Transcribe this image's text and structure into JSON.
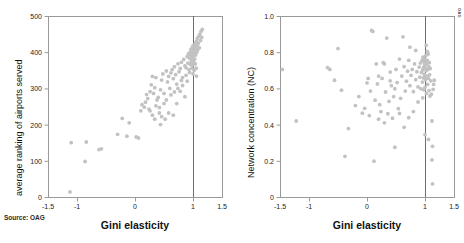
{
  "figure": {
    "source_note": "Source: OAG",
    "corner_mark": "OAG",
    "point_color": "#c2c2c2",
    "frame_color": "#9a9a9a",
    "refline_color": "#6e6e6e"
  },
  "chart_data": [
    {
      "type": "scatter",
      "panel": "left",
      "title": "",
      "xlabel": "Gini elasticity",
      "ylabel": "average ranking of airports served",
      "xlim": [
        -1.5,
        1.5
      ],
      "ylim": [
        0,
        500
      ],
      "xticks": [
        -1.5,
        -1,
        0,
        1,
        1.5
      ],
      "xticklabels": [
        "-1.5",
        "-1",
        "0",
        "1",
        "1.5"
      ],
      "yticks": [
        0,
        100,
        200,
        300,
        400,
        500
      ],
      "yticklabels": [
        "0",
        "100",
        "200",
        "300",
        "400",
        "500"
      ],
      "grid": false,
      "legend": "none",
      "annotations": [
        {
          "type": "vline",
          "x": 1,
          "label": "reference line at Gini elasticity = 1"
        }
      ],
      "points": [
        [
          -1.12,
          14
        ],
        [
          -1.1,
          150
        ],
        [
          -0.86,
          98
        ],
        [
          -0.84,
          152
        ],
        [
          -0.62,
          131
        ],
        [
          -0.58,
          133
        ],
        [
          -0.3,
          173
        ],
        [
          -0.22,
          217
        ],
        [
          -0.14,
          168
        ],
        [
          -0.1,
          205
        ],
        [
          0.02,
          166
        ],
        [
          0.06,
          163
        ],
        [
          0.1,
          238
        ],
        [
          0.12,
          255
        ],
        [
          0.16,
          248
        ],
        [
          0.18,
          262
        ],
        [
          0.2,
          283
        ],
        [
          0.22,
          272
        ],
        [
          0.24,
          243
        ],
        [
          0.26,
          291
        ],
        [
          0.28,
          310
        ],
        [
          0.3,
          333
        ],
        [
          0.32,
          286
        ],
        [
          0.34,
          302
        ],
        [
          0.36,
          330
        ],
        [
          0.38,
          268
        ],
        [
          0.4,
          275
        ],
        [
          0.42,
          247
        ],
        [
          0.44,
          296
        ],
        [
          0.46,
          323
        ],
        [
          0.48,
          340
        ],
        [
          0.5,
          286
        ],
        [
          0.52,
          215
        ],
        [
          0.54,
          348
        ],
        [
          0.56,
          318
        ],
        [
          0.58,
          333
        ],
        [
          0.6,
          300
        ],
        [
          0.62,
          343
        ],
        [
          0.64,
          352
        ],
        [
          0.66,
          327
        ],
        [
          0.68,
          360
        ],
        [
          0.7,
          338
        ],
        [
          0.72,
          312
        ],
        [
          0.74,
          368
        ],
        [
          0.76,
          346
        ],
        [
          0.78,
          355
        ],
        [
          0.8,
          372
        ],
        [
          0.82,
          330
        ],
        [
          0.84,
          380
        ],
        [
          0.86,
          362
        ],
        [
          0.88,
          357
        ],
        [
          0.9,
          388
        ],
        [
          0.91,
          370
        ],
        [
          0.92,
          395
        ],
        [
          0.93,
          352
        ],
        [
          0.94,
          383
        ],
        [
          0.95,
          400
        ],
        [
          0.955,
          366
        ],
        [
          0.96,
          392
        ],
        [
          0.965,
          408
        ],
        [
          0.97,
          374
        ],
        [
          0.975,
          398
        ],
        [
          0.98,
          386
        ],
        [
          0.985,
          412
        ],
        [
          0.99,
          377
        ],
        [
          0.995,
          403
        ],
        [
          1.0,
          390
        ],
        [
          1.0,
          365
        ],
        [
          1.0,
          418
        ],
        [
          1.005,
          384
        ],
        [
          1.01,
          402
        ],
        [
          1.015,
          372
        ],
        [
          1.02,
          396
        ],
        [
          1.025,
          415
        ],
        [
          1.03,
          381
        ],
        [
          1.035,
          407
        ],
        [
          1.04,
          424
        ],
        [
          1.045,
          392
        ],
        [
          1.05,
          410
        ],
        [
          1.055,
          356
        ],
        [
          1.06,
          430
        ],
        [
          1.065,
          400
        ],
        [
          1.07,
          418
        ],
        [
          1.075,
          438
        ],
        [
          1.08,
          406
        ],
        [
          1.09,
          424
        ],
        [
          1.1,
          444
        ],
        [
          1.11,
          412
        ],
        [
          1.12,
          450
        ],
        [
          1.13,
          432
        ],
        [
          1.14,
          458
        ],
        [
          1.15,
          441
        ],
        [
          1.16,
          463
        ],
        [
          1.06,
          334
        ],
        [
          0.86,
          277
        ],
        [
          0.72,
          258
        ],
        [
          0.58,
          232
        ],
        [
          0.46,
          222
        ],
        [
          0.66,
          226
        ],
        [
          0.34,
          215
        ],
        [
          0.78,
          292
        ],
        [
          0.9,
          320
        ],
        [
          1.0,
          340
        ],
        [
          1.02,
          350
        ],
        [
          0.62,
          282
        ],
        [
          0.5,
          258
        ],
        [
          0.44,
          200
        ],
        [
          0.26,
          238
        ],
        [
          0.36,
          252
        ],
        [
          0.82,
          308
        ],
        [
          0.98,
          356
        ],
        [
          1.04,
          368
        ],
        [
          0.94,
          344
        ],
        [
          0.88,
          336
        ],
        [
          0.8,
          322
        ],
        [
          0.74,
          300
        ],
        [
          0.68,
          290
        ],
        [
          0.54,
          268
        ],
        [
          0.42,
          232
        ],
        [
          0.3,
          226
        ]
      ]
    },
    {
      "type": "scatter",
      "panel": "right",
      "title": "",
      "xlabel": "Gini elasticity",
      "ylabel": "Network concentration (NC)",
      "xlim": [
        -1.5,
        1.5
      ],
      "ylim": [
        0,
        1.0
      ],
      "xticks": [
        -1.5,
        -1,
        0,
        1,
        1.5
      ],
      "xticklabels": [
        "-1.5",
        "-1",
        "0",
        "1",
        "1.5"
      ],
      "yticks": [
        0,
        0.2,
        0.4,
        0.6,
        0.8,
        1.0
      ],
      "yticklabels": [
        "0",
        "0.2",
        "0.4",
        "0.6",
        "0.8",
        "1.0"
      ],
      "grid": false,
      "legend": "none",
      "annotations": [
        {
          "type": "vline",
          "x": 1,
          "label": "reference line at Gini elasticity = 1"
        }
      ],
      "points": [
        [
          -1.46,
          0.705
        ],
        [
          -1.22,
          0.42
        ],
        [
          -0.68,
          0.715
        ],
        [
          -0.64,
          0.705
        ],
        [
          -0.56,
          0.645
        ],
        [
          -0.5,
          0.82
        ],
        [
          -0.44,
          0.59
        ],
        [
          -0.38,
          0.225
        ],
        [
          -0.32,
          0.378
        ],
        [
          -0.2,
          0.505
        ],
        [
          -0.14,
          0.555
        ],
        [
          -0.08,
          0.463
        ],
        [
          -0.04,
          0.49
        ],
        [
          0.0,
          0.63
        ],
        [
          0.02,
          0.655
        ],
        [
          0.04,
          0.45
        ],
        [
          0.06,
          0.585
        ],
        [
          0.08,
          0.92
        ],
        [
          0.1,
          0.915
        ],
        [
          0.12,
          0.198
        ],
        [
          0.14,
          0.535
        ],
        [
          0.16,
          0.735
        ],
        [
          0.18,
          0.625
        ],
        [
          0.2,
          0.43
        ],
        [
          0.22,
          0.51
        ],
        [
          0.24,
          0.472
        ],
        [
          0.26,
          0.655
        ],
        [
          0.28,
          0.742
        ],
        [
          0.3,
          0.41
        ],
        [
          0.32,
          0.58
        ],
        [
          0.34,
          0.878
        ],
        [
          0.36,
          0.46
        ],
        [
          0.38,
          0.528
        ],
        [
          0.4,
          0.69
        ],
        [
          0.42,
          0.615
        ],
        [
          0.44,
          0.435
        ],
        [
          0.46,
          0.555
        ],
        [
          0.48,
          0.275
        ],
        [
          0.5,
          0.705
        ],
        [
          0.52,
          0.632
        ],
        [
          0.54,
          0.488
        ],
        [
          0.56,
          0.762
        ],
        [
          0.58,
          0.545
        ],
        [
          0.6,
          0.668
        ],
        [
          0.62,
          0.885
        ],
        [
          0.64,
          0.72
        ],
        [
          0.66,
          0.585
        ],
        [
          0.68,
          0.64
        ],
        [
          0.7,
          0.695
        ],
        [
          0.72,
          0.755
        ],
        [
          0.74,
          0.615
        ],
        [
          0.76,
          0.672
        ],
        [
          0.78,
          0.705
        ],
        [
          0.8,
          0.582
        ],
        [
          0.82,
          0.735
        ],
        [
          0.84,
          0.648
        ],
        [
          0.86,
          0.692
        ],
        [
          0.88,
          0.608
        ],
        [
          0.9,
          0.718
        ],
        [
          0.91,
          0.662
        ],
        [
          0.92,
          0.74
        ],
        [
          0.93,
          0.598
        ],
        [
          0.94,
          0.688
        ],
        [
          0.95,
          0.755
        ],
        [
          0.955,
          0.635
        ],
        [
          0.96,
          0.702
        ],
        [
          0.965,
          0.772
        ],
        [
          0.97,
          0.658
        ],
        [
          0.975,
          0.715
        ],
        [
          0.98,
          0.592
        ],
        [
          0.985,
          0.745
        ],
        [
          0.99,
          0.678
        ],
        [
          0.995,
          0.728
        ],
        [
          1.0,
          0.665
        ],
        [
          1.0,
          0.76
        ],
        [
          1.0,
          0.605
        ],
        [
          1.005,
          0.712
        ],
        [
          1.01,
          0.648
        ],
        [
          1.015,
          0.782
        ],
        [
          1.02,
          0.698
        ],
        [
          1.025,
          0.572
        ],
        [
          1.03,
          0.735
        ],
        [
          1.035,
          0.668
        ],
        [
          1.04,
          0.755
        ],
        [
          1.045,
          0.622
        ],
        [
          1.05,
          0.705
        ],
        [
          1.055,
          0.79
        ],
        [
          1.06,
          0.655
        ],
        [
          1.065,
          0.72
        ],
        [
          1.07,
          0.588
        ],
        [
          1.075,
          0.742
        ],
        [
          1.08,
          0.675
        ],
        [
          1.085,
          0.558
        ],
        [
          1.09,
          0.71
        ],
        [
          1.1,
          0.642
        ],
        [
          1.11,
          0.568
        ],
        [
          1.12,
          0.42
        ],
        [
          1.12,
          0.205
        ],
        [
          1.13,
          0.28
        ],
        [
          1.13,
          0.072
        ],
        [
          1.06,
          0.318
        ],
        [
          1.0,
          0.345
        ],
        [
          0.96,
          0.548
        ],
        [
          0.88,
          0.525
        ],
        [
          0.8,
          0.472
        ],
        [
          0.72,
          0.438
        ],
        [
          0.64,
          0.385
        ],
        [
          0.56,
          0.462
        ],
        [
          0.48,
          0.598
        ],
        [
          0.4,
          0.642
        ],
        [
          0.3,
          0.735
        ],
        [
          0.2,
          0.668
        ],
        [
          1.14,
          0.595
        ],
        [
          1.15,
          0.622
        ],
        [
          1.16,
          0.645
        ],
        [
          0.84,
          0.81
        ],
        [
          0.74,
          0.828
        ],
        [
          1.02,
          0.838
        ],
        [
          1.04,
          0.805
        ]
      ]
    }
  ]
}
